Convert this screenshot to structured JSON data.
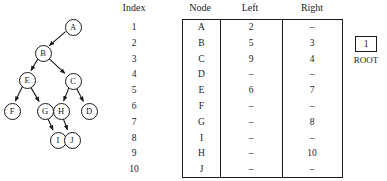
{
  "figure": {
    "type": "binary-tree-with-linked-representation-table"
  },
  "tree": {
    "nodes": [
      {
        "id": "A",
        "label": "A",
        "x": 72,
        "y": 26
      },
      {
        "id": "B",
        "label": "B",
        "x": 42,
        "y": 52
      },
      {
        "id": "E",
        "label": "E",
        "x": 26,
        "y": 79
      },
      {
        "id": "C",
        "label": "C",
        "x": 72,
        "y": 80
      },
      {
        "id": "F",
        "label": "F",
        "x": 11,
        "y": 110
      },
      {
        "id": "G",
        "label": "G",
        "x": 44,
        "y": 110
      },
      {
        "id": "H",
        "label": "H",
        "x": 60,
        "y": 110
      },
      {
        "id": "D",
        "label": "D",
        "x": 88,
        "y": 110
      },
      {
        "id": "I",
        "label": "I",
        "x": 57,
        "y": 139
      },
      {
        "id": "J",
        "label": "J",
        "x": 71,
        "y": 139
      }
    ],
    "edges": [
      {
        "from": "A",
        "to": "B"
      },
      {
        "from": "B",
        "to": "E"
      },
      {
        "from": "B",
        "to": "C"
      },
      {
        "from": "E",
        "to": "F"
      },
      {
        "from": "E",
        "to": "G"
      },
      {
        "from": "C",
        "to": "H"
      },
      {
        "from": "C",
        "to": "D"
      },
      {
        "from": "G",
        "to": "I"
      },
      {
        "from": "H",
        "to": "J"
      }
    ]
  },
  "table": {
    "headers": {
      "index": "Index",
      "node": "Node",
      "left": "Left",
      "right": "Right"
    },
    "rows": [
      {
        "index": "1",
        "node": "A",
        "left": "2",
        "right": "–"
      },
      {
        "index": "2",
        "node": "B",
        "left": "5",
        "right": "3"
      },
      {
        "index": "3",
        "node": "C",
        "left": "9",
        "right": "4"
      },
      {
        "index": "4",
        "node": "D",
        "left": "–",
        "right": "–"
      },
      {
        "index": "5",
        "node": "E",
        "left": "6",
        "right": "7"
      },
      {
        "index": "6",
        "node": "F",
        "left": "–",
        "right": "–"
      },
      {
        "index": "7",
        "node": "G",
        "left": "–",
        "right": "8"
      },
      {
        "index": "8",
        "node": "I",
        "left": "–",
        "right": "–"
      },
      {
        "index": "9",
        "node": "H",
        "left": "–",
        "right": "10"
      },
      {
        "index": "10",
        "node": "J",
        "left": "–",
        "right": "–"
      }
    ]
  },
  "root_pointer": {
    "value": "1",
    "label": "ROOT"
  },
  "colors": {
    "ink": "#1a1a1a",
    "paper": "#ffffff"
  }
}
